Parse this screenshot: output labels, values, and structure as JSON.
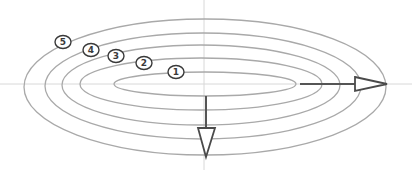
{
  "diagram": {
    "colors": {
      "background": "#ffffff",
      "contour": "#a9a9a9",
      "axis": "#d8d8d8",
      "arrow": "#4a4a4a",
      "label": "#3a3a3a"
    },
    "axes": {
      "horizontal": {
        "x1": 0,
        "y1": 84,
        "x2": 412,
        "y2": 84
      },
      "vertical": {
        "x1": 204,
        "y1": 0,
        "x2": 204,
        "y2": 170
      }
    },
    "contours": [
      {
        "id": "1",
        "cx": 205,
        "cy": 84,
        "rx": 91,
        "ry": 12
      },
      {
        "id": "2",
        "cx": 201,
        "cy": 84,
        "rx": 121,
        "ry": 26
      },
      {
        "id": "3",
        "cx": 201,
        "cy": 85,
        "rx": 139,
        "ry": 40
      },
      {
        "id": "4",
        "cx": 203,
        "cy": 86,
        "rx": 158,
        "ry": 53
      },
      {
        "id": "5",
        "cx": 205,
        "cy": 87,
        "rx": 181,
        "ry": 68
      }
    ],
    "labels": [
      {
        "text": "5",
        "x": 63,
        "y": 42
      },
      {
        "text": "4",
        "x": 91,
        "y": 50
      },
      {
        "text": "3",
        "x": 116,
        "y": 56
      },
      {
        "text": "2",
        "x": 144,
        "y": 63
      },
      {
        "text": "1",
        "x": 176,
        "y": 72
      }
    ],
    "arrows": [
      {
        "name": "horizontal-arrow",
        "direction": "right",
        "shaft": {
          "x1": 300,
          "y1": 84,
          "x2": 355,
          "y2": 84
        },
        "head": "355,77 387,84 355,91"
      },
      {
        "name": "vertical-arrow",
        "direction": "down",
        "shaft": {
          "x1": 206,
          "y1": 96,
          "x2": 206,
          "y2": 128
        },
        "head": "198,128 215,128 206,157"
      }
    ]
  }
}
